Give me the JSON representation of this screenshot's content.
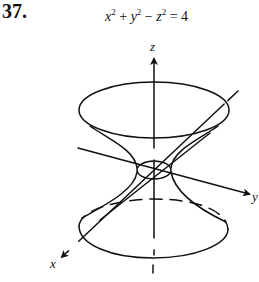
{
  "problem": {
    "number": "37.",
    "equation": {
      "x_term": "x",
      "y_term": "y",
      "z_term": "z",
      "exponent": "2",
      "plus": " + ",
      "minus": " − ",
      "equals": " = ",
      "rhs": "4",
      "full_text": "x^2 + y^2 - z^2 = 4"
    }
  },
  "figure": {
    "type": "hyperboloid-of-one-sheet",
    "axes": {
      "x_label": "x",
      "y_label": "y",
      "z_label": "z"
    },
    "colors": {
      "stroke": "#111111",
      "background": "#ffffff"
    }
  }
}
